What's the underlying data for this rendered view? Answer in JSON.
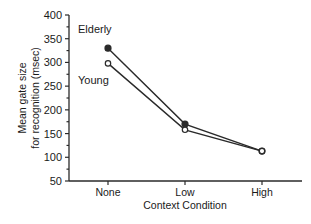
{
  "chart_data": {
    "type": "line",
    "title": "",
    "xlabel": "Context Condition",
    "ylabel": [
      "Mean gate size",
      "for recognition (msec)"
    ],
    "categories": [
      "None",
      "Low",
      "High"
    ],
    "series": [
      {
        "name": "Elderly",
        "marker": "filled-circle",
        "values": [
          330,
          170,
          113
        ]
      },
      {
        "name": "Young",
        "marker": "open-circle",
        "values": [
          298,
          158,
          113
        ]
      }
    ],
    "ylim": [
      50,
      400
    ],
    "yticks": [
      50,
      100,
      150,
      200,
      250,
      300,
      350,
      400
    ],
    "yminor_step": 25,
    "grid": false,
    "legend": "inline labels near first points (upper left)"
  },
  "labels": {
    "elderly": "Elderly",
    "young": "Young",
    "xlabel": "Context Condition",
    "ylabel_line1": "Mean gate size",
    "ylabel_line2": "for recognition (msec)",
    "xticks": [
      "None",
      "Low",
      "High"
    ],
    "yticks": [
      "50",
      "100",
      "150",
      "200",
      "250",
      "300",
      "350",
      "400"
    ]
  },
  "colors": {
    "line": "#2a2a2a",
    "text": "#1a1a1a",
    "background": "#ffffff"
  }
}
